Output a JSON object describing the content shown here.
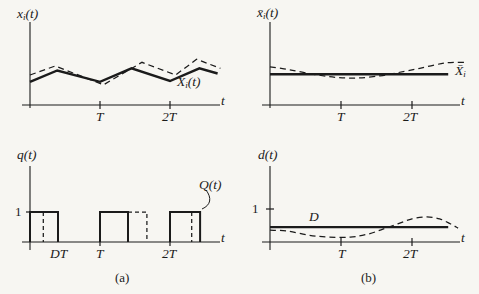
{
  "figure": {
    "bg_color": "#f7f6f2",
    "ink_color": "#1b1b1b",
    "caption_a": "(a)",
    "caption_b": "(b)"
  },
  "labels": {
    "tl_axis_y": {
      "pre": "x",
      "sub": "i",
      "post": "(t)"
    },
    "tl_curve": {
      "pre": "X",
      "sub": "i",
      "post": "(t)"
    },
    "tl_tick_T": "T",
    "tl_tick_2T": "2T",
    "tl_t": "t",
    "tr_axis_y": {
      "pre": "x̄",
      "sub": "i",
      "post": "(t)"
    },
    "tr_curve": {
      "pre": "X̄",
      "sub": "i",
      "post": ""
    },
    "tr_tick_T": "T",
    "tr_tick_2T": "2T",
    "tr_t": "t",
    "bl_axis_y": {
      "pre": "q(t)",
      "sub": "",
      "post": ""
    },
    "bl_curve": {
      "pre": "Q(t)",
      "sub": "",
      "post": ""
    },
    "bl_one": "1",
    "bl_tick_DT": "DT",
    "bl_tick_T": "T",
    "bl_tick_2T": "2T",
    "bl_t": "t",
    "br_axis_y": {
      "pre": "d(t)",
      "sub": "",
      "post": ""
    },
    "br_one": "1",
    "br_D": "D",
    "br_tick_T": "T",
    "br_tick_2T": "2T",
    "br_t": "t"
  },
  "chart_data": [
    {
      "id": "xi-panel",
      "type": "line",
      "ylabel": "xᵢ(t)",
      "xlabel": "t",
      "x_ticks": [
        "T",
        "2T"
      ],
      "y_ticks": [],
      "x_unit": "T",
      "xlim": [
        0,
        2.75
      ],
      "ylim": [
        0,
        1
      ],
      "series": [
        {
          "name": "Xᵢ(t) averaged waveform",
          "style": "solid",
          "points": [
            [
              0,
              0.31
            ],
            [
              0.39,
              0.46
            ],
            [
              1.0,
              0.31
            ],
            [
              1.45,
              0.49
            ],
            [
              2.0,
              0.32
            ],
            [
              2.42,
              0.49
            ],
            [
              2.68,
              0.42
            ]
          ]
        },
        {
          "name": "xᵢ(t) actual waveform",
          "style": "dashed",
          "points": [
            [
              0,
              0.4
            ],
            [
              0.36,
              0.52
            ],
            [
              1.05,
              0.27
            ],
            [
              1.6,
              0.57
            ],
            [
              2.08,
              0.4
            ],
            [
              2.38,
              0.61
            ],
            [
              2.72,
              0.49
            ]
          ]
        }
      ]
    },
    {
      "id": "xbar-panel",
      "type": "line",
      "ylabel": "x̄ᵢ(t)",
      "xlabel": "t",
      "x_ticks": [
        "T",
        "2T"
      ],
      "y_ticks": [],
      "x_unit": "T",
      "xlim": [
        0,
        2.76
      ],
      "ylim": [
        0,
        1
      ],
      "series": [
        {
          "name": "X̄ᵢ constant average",
          "style": "solid",
          "points": [
            [
              0,
              0.41
            ],
            [
              2.51,
              0.41
            ]
          ]
        },
        {
          "name": "x̄ᵢ(t) moving average",
          "style": "dashed",
          "smooth": true,
          "points": [
            [
              0,
              0.51
            ],
            [
              0.28,
              0.47
            ],
            [
              0.61,
              0.41
            ],
            [
              0.92,
              0.37
            ],
            [
              1.23,
              0.36
            ],
            [
              1.55,
              0.39
            ],
            [
              1.79,
              0.43
            ],
            [
              2.11,
              0.49
            ],
            [
              2.47,
              0.56
            ],
            [
              2.76,
              0.57
            ]
          ]
        }
      ]
    },
    {
      "id": "q-panel",
      "type": "line",
      "ylabel": "q(t)",
      "xlabel": "t",
      "x_ticks": [
        "DT",
        "T",
        "2T"
      ],
      "y_ticks": [
        "1"
      ],
      "x_unit": "T",
      "xlim": [
        0,
        2.75
      ],
      "ylim": [
        0,
        1.5
      ],
      "nominal_duty_D": 0.4,
      "series": [
        {
          "name": "Q(t) nominal pulse train, duty D",
          "style": "solid",
          "segments": [
            [
              [
                0,
                0
              ],
              [
                0,
                1
              ],
              [
                0.4,
                1
              ],
              [
                0.4,
                0
              ]
            ],
            [
              [
                1,
                0
              ],
              [
                1,
                1
              ],
              [
                1.4,
                1
              ],
              [
                1.4,
                0
              ]
            ],
            [
              [
                2,
                0
              ],
              [
                2,
                1
              ],
              [
                2.43,
                1
              ],
              [
                2.43,
                0
              ]
            ]
          ]
        },
        {
          "name": "q(t) perturbed switching edges",
          "style": "dashed",
          "segments": [
            [
              [
                0.19,
                1
              ],
              [
                0.19,
                0
              ]
            ],
            [
              [
                1.4,
                1
              ],
              [
                1.67,
                1
              ],
              [
                1.67,
                0
              ]
            ],
            [
              [
                2.31,
                1
              ],
              [
                2.31,
                0
              ]
            ]
          ]
        }
      ]
    },
    {
      "id": "d-panel",
      "type": "line",
      "ylabel": "d(t)",
      "xlabel": "t",
      "x_ticks": [
        "T",
        "2T"
      ],
      "y_ticks": [
        "1"
      ],
      "x_unit": "T",
      "xlim": [
        0,
        2.7
      ],
      "ylim": [
        0,
        1.3
      ],
      "series": [
        {
          "name": "D constant duty cycle",
          "style": "solid",
          "points": [
            [
              0,
              0.45
            ],
            [
              2.51,
              0.45
            ]
          ]
        },
        {
          "name": "d(t) varying duty cycle",
          "style": "dashed",
          "smooth": true,
          "points": [
            [
              0,
              0.36
            ],
            [
              0.25,
              0.33
            ],
            [
              0.54,
              0.21
            ],
            [
              0.82,
              0.15
            ],
            [
              1.13,
              0.15
            ],
            [
              1.38,
              0.24
            ],
            [
              1.59,
              0.39
            ],
            [
              1.8,
              0.55
            ],
            [
              2.0,
              0.7
            ],
            [
              2.21,
              0.76
            ],
            [
              2.39,
              0.7
            ],
            [
              2.54,
              0.55
            ],
            [
              2.65,
              0.42
            ]
          ]
        }
      ]
    }
  ]
}
